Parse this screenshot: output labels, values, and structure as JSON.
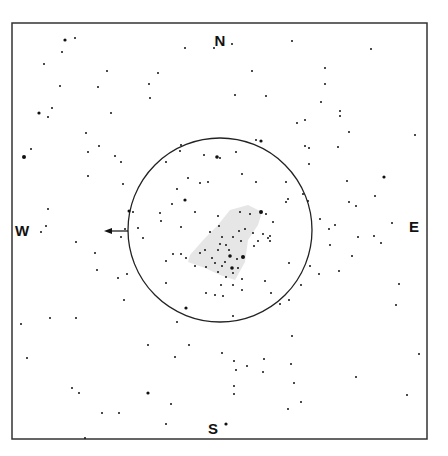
{
  "chart": {
    "frame": {
      "x": 12,
      "y": 23,
      "w": 415,
      "h": 416,
      "stroke": "#333333"
    },
    "circle": {
      "cx": 220,
      "cy": 230,
      "r": 92,
      "stroke": "#222222"
    },
    "arrow": {
      "x1": 128,
      "y1": 231,
      "x2": 104,
      "y2": 231
    },
    "nebula_color": "#e6e6e6",
    "directions": {
      "north": {
        "label": "N",
        "x": 220,
        "y": 40
      },
      "south": {
        "label": "S",
        "x": 213,
        "y": 428
      },
      "west": {
        "label": "W",
        "x": 22,
        "y": 230
      },
      "east": {
        "label": "E",
        "x": 414,
        "y": 226
      }
    },
    "stars": [
      [
        65,
        40,
        1.6
      ],
      [
        75,
        38,
        1
      ],
      [
        62,
        52,
        1
      ],
      [
        44,
        64,
        1
      ],
      [
        60,
        86,
        1
      ],
      [
        107,
        71,
        1
      ],
      [
        98,
        87,
        1
      ],
      [
        149,
        84,
        1
      ],
      [
        158,
        73,
        1
      ],
      [
        150,
        98,
        1
      ],
      [
        39,
        113,
        1.6
      ],
      [
        52,
        108,
        1
      ],
      [
        48,
        117,
        1
      ],
      [
        111,
        113,
        1
      ],
      [
        86,
        133,
        1
      ],
      [
        99,
        146,
        1
      ],
      [
        88,
        152,
        1
      ],
      [
        115,
        156,
        1
      ],
      [
        121,
        162,
        1
      ],
      [
        88,
        176,
        1
      ],
      [
        24,
        157,
        2
      ],
      [
        31,
        149,
        1
      ],
      [
        123,
        184,
        1
      ],
      [
        48,
        209,
        1
      ],
      [
        129,
        211,
        1.5
      ],
      [
        133,
        212,
        1
      ],
      [
        185,
        48,
        1
      ],
      [
        214,
        48,
        1
      ],
      [
        232,
        44,
        1
      ],
      [
        292,
        41,
        1
      ],
      [
        371,
        49,
        1
      ],
      [
        252,
        71,
        1
      ],
      [
        325,
        68,
        1
      ],
      [
        235,
        95,
        1
      ],
      [
        266,
        96,
        1
      ],
      [
        325,
        84,
        1
      ],
      [
        321,
        102,
        1
      ],
      [
        297,
        123,
        1
      ],
      [
        305,
        120,
        1
      ],
      [
        340,
        111,
        1
      ],
      [
        340,
        116,
        1
      ],
      [
        349,
        132,
        1
      ],
      [
        415,
        135,
        1
      ],
      [
        305,
        146,
        1
      ],
      [
        309,
        148,
        1
      ],
      [
        338,
        147,
        1
      ],
      [
        309,
        164,
        1
      ],
      [
        256,
        140,
        1
      ],
      [
        261,
        141,
        1.6
      ],
      [
        236,
        152,
        1
      ],
      [
        242,
        174,
        1
      ],
      [
        256,
        182,
        1
      ],
      [
        286,
        182,
        1
      ],
      [
        347,
        181,
        1
      ],
      [
        384,
        177,
        1.6
      ],
      [
        375,
        196,
        1
      ],
      [
        349,
        202,
        1
      ],
      [
        356,
        206,
        1
      ],
      [
        286,
        202,
        1
      ],
      [
        288,
        199,
        1
      ],
      [
        308,
        201,
        1
      ],
      [
        261,
        212,
        2
      ],
      [
        181,
        145,
        1
      ],
      [
        180,
        151,
        1
      ],
      [
        204,
        155,
        1
      ],
      [
        217,
        157,
        1.8
      ],
      [
        220,
        158,
        1
      ],
      [
        166,
        162,
        1
      ],
      [
        188,
        178,
        1
      ],
      [
        200,
        183,
        1
      ],
      [
        208,
        182,
        1
      ],
      [
        177,
        189,
        1
      ],
      [
        185,
        200,
        1.6
      ],
      [
        160,
        213,
        1
      ],
      [
        161,
        221,
        1
      ],
      [
        172,
        204,
        1
      ],
      [
        195,
        212,
        1
      ],
      [
        218,
        216,
        1
      ],
      [
        240,
        212,
        1
      ],
      [
        250,
        214,
        1
      ],
      [
        266,
        214,
        1
      ],
      [
        273,
        222,
        1
      ],
      [
        219,
        226,
        1
      ],
      [
        239,
        231,
        1
      ],
      [
        222,
        237,
        1
      ],
      [
        233,
        237,
        1
      ],
      [
        268,
        238,
        1
      ],
      [
        270,
        241,
        1
      ],
      [
        245,
        229,
        1
      ],
      [
        220,
        244,
        1
      ],
      [
        226,
        245,
        1
      ],
      [
        229,
        250,
        1
      ],
      [
        230,
        256,
        1.8
      ],
      [
        237,
        259,
        1
      ],
      [
        243,
        257,
        2
      ],
      [
        225,
        262,
        1
      ],
      [
        218,
        250,
        1
      ],
      [
        205,
        250,
        1
      ],
      [
        200,
        253,
        1
      ],
      [
        212,
        258,
        1
      ],
      [
        215,
        263,
        1
      ],
      [
        222,
        266,
        1
      ],
      [
        238,
        268,
        1
      ],
      [
        226,
        277,
        1
      ],
      [
        221,
        285,
        1
      ],
      [
        242,
        290,
        1
      ],
      [
        215,
        295,
        1
      ],
      [
        181,
        254,
        1
      ],
      [
        186,
        258,
        1
      ],
      [
        195,
        266,
        1
      ],
      [
        181,
        227,
        1
      ],
      [
        173,
        254,
        1
      ],
      [
        206,
        267,
        1
      ],
      [
        218,
        272,
        1
      ],
      [
        232,
        268,
        1.8
      ],
      [
        233,
        273,
        1
      ],
      [
        210,
        232,
        1
      ],
      [
        241,
        241,
        1
      ],
      [
        254,
        246,
        1
      ],
      [
        206,
        293,
        1
      ],
      [
        223,
        296,
        1
      ],
      [
        233,
        285,
        1
      ],
      [
        253,
        233,
        1
      ],
      [
        263,
        234,
        1
      ],
      [
        270,
        236,
        1
      ],
      [
        76,
        242,
        1
      ],
      [
        95,
        253,
        1
      ],
      [
        97,
        270,
        1
      ],
      [
        118,
        278,
        1
      ],
      [
        127,
        274,
        1
      ],
      [
        124,
        300,
        1
      ],
      [
        166,
        261,
        1
      ],
      [
        166,
        283,
        1
      ],
      [
        186,
        308,
        1.6
      ],
      [
        177,
        322,
        1
      ],
      [
        143,
        238,
        1
      ],
      [
        121,
        237,
        1
      ],
      [
        138,
        228,
        1
      ],
      [
        125,
        229,
        1
      ],
      [
        41,
        232,
        1
      ],
      [
        46,
        226,
        1
      ],
      [
        50,
        318,
        1
      ],
      [
        21,
        324,
        1
      ],
      [
        76,
        318,
        1
      ],
      [
        27,
        358,
        1
      ],
      [
        148,
        345,
        1
      ],
      [
        189,
        345,
        1
      ],
      [
        175,
        357,
        1
      ],
      [
        148,
        393,
        1.6
      ],
      [
        72,
        388,
        1
      ],
      [
        79,
        393,
        1
      ],
      [
        171,
        404,
        1
      ],
      [
        119,
        413,
        1
      ],
      [
        102,
        413,
        1
      ],
      [
        85,
        438,
        1
      ],
      [
        166,
        424,
        1
      ],
      [
        233,
        316,
        1
      ],
      [
        292,
        336,
        1
      ],
      [
        294,
        383,
        1
      ],
      [
        291,
        364,
        1
      ],
      [
        264,
        359,
        1
      ],
      [
        301,
        402,
        1
      ],
      [
        288,
        409,
        1
      ],
      [
        356,
        377,
        1
      ],
      [
        263,
        372,
        1
      ],
      [
        247,
        366,
        1
      ],
      [
        234,
        386,
        1
      ],
      [
        236,
        370,
        1
      ],
      [
        234,
        394,
        1
      ],
      [
        226,
        424,
        1.6
      ],
      [
        222,
        353,
        1
      ],
      [
        234,
        361,
        1
      ],
      [
        310,
        266,
        1
      ],
      [
        319,
        274,
        1
      ],
      [
        339,
        271,
        1
      ],
      [
        352,
        256,
        1
      ],
      [
        381,
        243,
        1
      ],
      [
        399,
        284,
        1
      ],
      [
        396,
        305,
        1
      ],
      [
        419,
        354,
        1
      ],
      [
        407,
        395,
        1
      ],
      [
        289,
        300,
        1
      ],
      [
        280,
        304,
        1
      ],
      [
        329,
        229,
        1
      ],
      [
        358,
        237,
        1
      ],
      [
        335,
        225,
        1
      ],
      [
        374,
        236,
        1
      ],
      [
        301,
        285,
        1
      ],
      [
        392,
        223,
        1
      ],
      [
        258,
        241,
        1
      ],
      [
        289,
        263,
        1
      ],
      [
        303,
        194,
        1
      ],
      [
        320,
        219,
        1
      ],
      [
        330,
        245,
        1
      ],
      [
        265,
        281,
        1
      ],
      [
        242,
        279,
        1
      ],
      [
        271,
        293,
        1
      ]
    ],
    "nebula": [
      [
        [
          190,
          255
        ],
        [
          205,
          238
        ],
        [
          218,
          225
        ],
        [
          230,
          210
        ],
        [
          248,
          205
        ],
        [
          262,
          212
        ],
        [
          258,
          225
        ],
        [
          248,
          240
        ],
        [
          245,
          262
        ],
        [
          235,
          280
        ],
        [
          220,
          275
        ],
        [
          205,
          268
        ],
        [
          188,
          262
        ]
      ]
    ]
  }
}
